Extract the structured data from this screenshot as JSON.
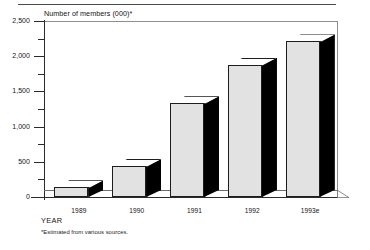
{
  "figure": {
    "y_axis_title": "Number of members (000)*",
    "x_axis_title": "YEAR",
    "footnote": "*Estimated from various sources."
  },
  "chart_data": {
    "type": "bar",
    "title": "",
    "subtitle": "",
    "xlabel": "YEAR",
    "ylabel": "Number of members (000)*",
    "categories": [
      "1989",
      "1990",
      "1991",
      "1992",
      "1993e"
    ],
    "values": [
      140,
      440,
      1330,
      1880,
      2210
    ],
    "ylim": [
      0,
      2500
    ],
    "ytick_labels": [
      "0",
      "500",
      "1,000",
      "1,500",
      "2,000",
      "2,500"
    ],
    "ytick_values": [
      0,
      500,
      1000,
      1500,
      2000,
      2500
    ],
    "yminor_tick_values": [
      250,
      750,
      1250,
      1750,
      2250
    ],
    "grid": false,
    "legend": null,
    "style": "3d-bar",
    "annotations": [
      "*Estimated from various sources."
    ],
    "colors": {
      "bar_front": "#e2e2e2",
      "bar_side": "#000000",
      "bar_top": "#ffffff",
      "axis": "#2b2b2b",
      "text": "#141414"
    }
  }
}
